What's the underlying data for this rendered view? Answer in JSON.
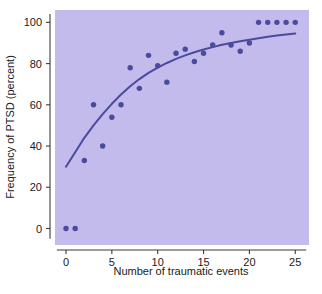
{
  "chart_data": {
    "type": "scatter",
    "title": "",
    "xlabel": "Number of traumatic events",
    "ylabel": "Frequency of PTSD (percent)",
    "xlim": [
      -1.2,
      26.5
    ],
    "ylim": [
      -8,
      106
    ],
    "xticks": [
      0,
      5,
      10,
      15,
      20,
      25
    ],
    "xtick_labels": [
      "0",
      "5",
      "10",
      "15",
      "20",
      "25"
    ],
    "yticks": [
      0,
      20,
      40,
      60,
      80,
      100
    ],
    "ytick_labels": [
      "0",
      "20",
      "40",
      "60",
      "80",
      "100"
    ],
    "grid": false,
    "legend": null,
    "plot_background_color": "#c2bbeb",
    "point_color": "#4a4a9e",
    "line_color": "#4a4a9e",
    "points": [
      {
        "x": 0,
        "y": 0
      },
      {
        "x": 1,
        "y": 0
      },
      {
        "x": 2,
        "y": 33
      },
      {
        "x": 3,
        "y": 60
      },
      {
        "x": 4,
        "y": 40
      },
      {
        "x": 5,
        "y": 54
      },
      {
        "x": 6,
        "y": 60
      },
      {
        "x": 7,
        "y": 78
      },
      {
        "x": 8,
        "y": 68
      },
      {
        "x": 9,
        "y": 84
      },
      {
        "x": 10,
        "y": 79
      },
      {
        "x": 11,
        "y": 71
      },
      {
        "x": 12,
        "y": 85
      },
      {
        "x": 13,
        "y": 87
      },
      {
        "x": 14,
        "y": 81
      },
      {
        "x": 15,
        "y": 85
      },
      {
        "x": 16,
        "y": 89
      },
      {
        "x": 17,
        "y": 95
      },
      {
        "x": 18,
        "y": 89
      },
      {
        "x": 19,
        "y": 86
      },
      {
        "x": 20,
        "y": 90
      },
      {
        "x": 21,
        "y": 100
      },
      {
        "x": 22,
        "y": 100
      },
      {
        "x": 23,
        "y": 100
      },
      {
        "x": 24,
        "y": 100
      },
      {
        "x": 25,
        "y": 100
      }
    ],
    "fit_curve": [
      {
        "x": 0,
        "y": 30
      },
      {
        "x": 1,
        "y": 37
      },
      {
        "x": 2,
        "y": 44
      },
      {
        "x": 3,
        "y": 50
      },
      {
        "x": 4,
        "y": 55.5
      },
      {
        "x": 5,
        "y": 60.5
      },
      {
        "x": 6,
        "y": 65
      },
      {
        "x": 7,
        "y": 69
      },
      {
        "x": 8,
        "y": 72.5
      },
      {
        "x": 9,
        "y": 75.5
      },
      {
        "x": 10,
        "y": 78
      },
      {
        "x": 11,
        "y": 80.3
      },
      {
        "x": 12,
        "y": 82.3
      },
      {
        "x": 13,
        "y": 84
      },
      {
        "x": 14,
        "y": 85.5
      },
      {
        "x": 15,
        "y": 86.8
      },
      {
        "x": 16,
        "y": 88
      },
      {
        "x": 17,
        "y": 89.1
      },
      {
        "x": 18,
        "y": 90
      },
      {
        "x": 19,
        "y": 90.8
      },
      {
        "x": 20,
        "y": 91.6
      },
      {
        "x": 21,
        "y": 92.3
      },
      {
        "x": 22,
        "y": 93
      },
      {
        "x": 23,
        "y": 93.6
      },
      {
        "x": 24,
        "y": 94.1
      },
      {
        "x": 25,
        "y": 94.6
      }
    ]
  }
}
